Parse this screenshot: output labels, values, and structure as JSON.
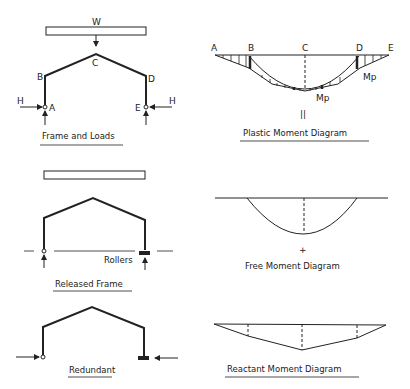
{
  "panels": {
    "frame_and_loads": {
      "caption": "Frame and Loads",
      "load_label": "W",
      "joint_labels": {
        "A": "A",
        "B": "B",
        "C": "C",
        "D": "D",
        "E": "E"
      },
      "horizontal_force_left": "H",
      "horizontal_force_right": "H"
    },
    "plastic_moment_diagram": {
      "caption": "Plastic Moment Diagram",
      "point_labels": [
        "A",
        "B",
        "C",
        "D",
        "E"
      ],
      "hinge_label_right": "Mp",
      "hinge_label_center": "Mp",
      "equals_sign": "||"
    },
    "released_frame": {
      "caption": "Released Frame",
      "support_label": "Rollers"
    },
    "free_moment_diagram": {
      "caption": "Free Moment Diagram",
      "plus_sign": "+"
    },
    "redundant": {
      "caption": "Redundant"
    },
    "reactant_moment_diagram": {
      "caption": "Reactant Moment Diagram"
    }
  },
  "colors": {
    "ink": "#222222",
    "background": "#ffffff"
  }
}
